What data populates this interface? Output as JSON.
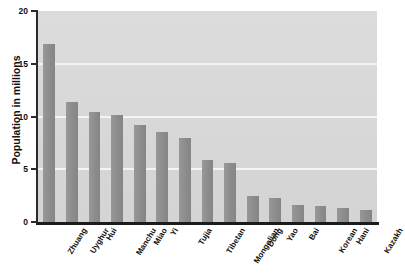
{
  "chart_data": {
    "type": "bar",
    "title": "",
    "xlabel": "",
    "ylabel": "Population in millions",
    "ylim": [
      0,
      20
    ],
    "yticks": [
      0,
      5,
      10,
      15,
      20
    ],
    "ytick_labels": [
      "0",
      "5",
      "10",
      "15",
      "20"
    ],
    "grid": true,
    "gridlines_at": [
      5,
      10,
      15
    ],
    "legend": null,
    "categories": [
      "Zhuang",
      "Uyghur",
      "Hui",
      "Manchu",
      "Miao",
      "Yi",
      "Tujia",
      "Tibetan",
      "Mongolian",
      "Dong",
      "Yao",
      "Bai",
      "Korean",
      "Hani",
      "Kazakh"
    ],
    "values": [
      16.9,
      11.4,
      10.4,
      10.1,
      9.2,
      8.5,
      8.0,
      5.9,
      5.6,
      2.5,
      2.3,
      1.6,
      1.5,
      1.3,
      1.1
    ],
    "bar_color": "#8f8f8f",
    "plot_background": "#d7d7d7",
    "gridline_color": "#f4f4f4",
    "axis_color": "#1c1c1c"
  },
  "figure": {
    "partial_title": ""
  }
}
